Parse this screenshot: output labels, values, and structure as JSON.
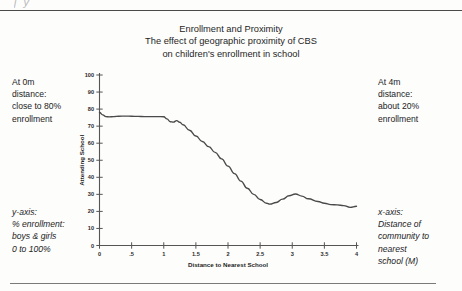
{
  "page": {
    "ghost_text": "j                                         y"
  },
  "title": {
    "lines": [
      "Enrollment and Proximity",
      "The effect of geographic proximity of CBS",
      "on children's enrollment in school"
    ]
  },
  "annotations": {
    "top_left": [
      "At 0m",
      "distance:",
      "close to 80%",
      "enrollment"
    ],
    "top_right": [
      "At 4m",
      "distance:",
      "about 20%",
      "enrollment"
    ],
    "bottom_left": [
      "y-axis:",
      "% enrollment:",
      "boys & girls",
      "0 to 100%"
    ],
    "bottom_right": [
      "x-axis:",
      "Distance of",
      "community to",
      "nearest",
      "school (M)"
    ]
  },
  "chart_data": {
    "type": "line",
    "title": "Enrollment and Proximity\nThe effect of geographic proximity of CBS\non children's enrollment in school",
    "xlabel": "Distance to Nearest School",
    "ylabel": "Attending School",
    "xlim": [
      0,
      4
    ],
    "ylim": [
      0,
      100
    ],
    "grid": false,
    "legend": null,
    "xticks": [
      0,
      0.5,
      1,
      1.5,
      2,
      2.5,
      3,
      3.5,
      4
    ],
    "xticklabels": [
      "0",
      ".5",
      "1",
      "1.5",
      "2",
      "2.5",
      "3",
      "3.5",
      "4"
    ],
    "yticks": [
      0,
      10,
      20,
      30,
      40,
      50,
      60,
      70,
      80,
      90,
      100
    ],
    "yticklabels": [
      "0",
      "10",
      "20",
      "30",
      "40",
      "50",
      "60",
      "70",
      "80",
      "90",
      "100"
    ],
    "series": [
      {
        "name": "Attending School",
        "x": [
          0.0,
          0.05,
          0.1,
          0.15,
          0.22,
          0.3,
          0.4,
          0.5,
          0.6,
          0.7,
          0.8,
          0.9,
          1.0,
          1.05,
          1.1,
          1.15,
          1.2,
          1.25,
          1.3,
          1.4,
          1.5,
          1.6,
          1.7,
          1.8,
          1.9,
          2.0,
          2.1,
          2.2,
          2.3,
          2.4,
          2.5,
          2.6,
          2.65,
          2.75,
          2.85,
          2.95,
          3.05,
          3.15,
          3.25,
          3.4,
          3.5,
          3.6,
          3.7,
          3.8,
          3.9,
          4.0
        ],
        "y": [
          78.0,
          76.6,
          75.6,
          75.4,
          75.6,
          75.8,
          75.9,
          75.8,
          75.7,
          75.6,
          75.6,
          75.6,
          75.5,
          74.3,
          72.6,
          72.4,
          73.2,
          72.3,
          70.8,
          67.6,
          64.2,
          61.0,
          58.0,
          54.6,
          50.8,
          46.6,
          42.2,
          37.8,
          33.6,
          30.0,
          27.0,
          24.8,
          24.3,
          25.2,
          27.2,
          29.2,
          30.2,
          29.0,
          27.4,
          25.8,
          24.8,
          24.0,
          23.8,
          23.4,
          22.4,
          23.0
        ]
      }
    ],
    "annotations": [
      {
        "at_x": 0,
        "text": "At 0m distance: close to 80% enrollment"
      },
      {
        "at_x": 4,
        "text": "At 4m distance: about 20% enrollment"
      }
    ]
  }
}
